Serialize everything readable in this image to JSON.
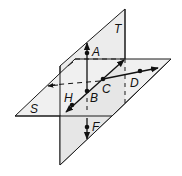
{
  "diagram": {
    "type": "geometry-intersecting-planes",
    "colors": {
      "plane_fill": "#e9e9e9",
      "plane_stroke": "#1a1a1a",
      "line": "#111111",
      "background": "#ffffff"
    },
    "planes": [
      {
        "id": "T",
        "label": "T"
      },
      {
        "id": "S",
        "label": "S"
      }
    ],
    "points": [
      {
        "id": "A",
        "label": "A"
      },
      {
        "id": "B",
        "label": "B"
      },
      {
        "id": "C",
        "label": "C"
      },
      {
        "id": "D",
        "label": "D"
      },
      {
        "id": "F",
        "label": "F"
      },
      {
        "id": "H",
        "label": "H"
      }
    ]
  }
}
